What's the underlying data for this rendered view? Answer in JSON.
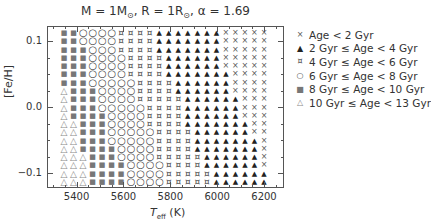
{
  "chart_data": {
    "type": "scatter",
    "title": "M = 1M⊙, R = 1R⊙, α = 1.69",
    "xlabel": "T_eff (K)",
    "ylabel": "[Fe/H]",
    "xlim": [
      5290,
      6300
    ],
    "ylim": [
      -0.17,
      0.17
    ],
    "xticks": [
      5400,
      5600,
      5800,
      6000,
      6200
    ],
    "yticks": [
      0.1,
      0.0,
      -0.1
    ],
    "ytick_labels": [
      "0.1",
      "0.0",
      "−0.1"
    ],
    "grid": false,
    "legend_position": "right",
    "legend": [
      {
        "code": "X",
        "label": "Age < 2 Gyr",
        "symbol": "×",
        "color": "#555555"
      },
      {
        "code": "A",
        "label": "2 Gyr ≤ Age < 4 Gyr",
        "symbol": "▲",
        "color": "#222222"
      },
      {
        "code": "H",
        "label": "4 Gyr ≤ Age < 6 Gyr",
        "symbol": "⌘",
        "color": "#444444"
      },
      {
        "code": "O",
        "label": "6 Gyr ≤ Age < 8 Gyr",
        "symbol": "○",
        "color": "#444444"
      },
      {
        "code": "S",
        "label": "8 Gyr ≤ Age < 10 Gyr",
        "symbol": "■",
        "color": "#777777"
      },
      {
        "code": "T",
        "label": "10 Gyr ≤ Age < 13 Gyr",
        "symbol": "△",
        "color": "#888888"
      }
    ],
    "grid_columns": 22,
    "grid_rows": 19,
    "teff_range": [
      5345,
      6195
    ],
    "feh_range": [
      0.16,
      -0.16
    ],
    "rows_top_to_bottom": [
      "SSOOOOHHHHAAAAAAAXXXXX",
      "SSOOOOHHHHAAAAAAAXXXXX",
      "SSSOOOHHHHAAAAAAAXXXXX",
      "SSSOOOOHHHHAAAAAAXXXXX",
      "SSSOOOOHHHHAAAAAAXXXXX",
      "SSSOOOOHHHHAAAAAAAXXXX",
      "SSSOOOOOHHHHAAAAAAXXXX",
      "TSSSOOOOHHHHAAAAAAXXXX",
      "TSSSOOOOHHHHHAAAAAAXXX",
      "TSSSOOOOOHHHHAAAAAAXXX",
      "TSSSSOOOOHHHHAAAAAAXXX",
      "TTSSSOOOOHHHHAAAAAAAXX",
      "TTSSSOOOOOHHHHAAAAAAXX",
      "TTSSSOOOOOHHHHAAAAAAAX",
      "TTSSSSOOOOHHHHAAAAAAAX",
      "TTTSSSOOOOHHHHHAAAAAAX",
      "TTTSSSSOOOOHHHHAAAAAAX",
      "TTTSSSSOOOOHHHHHAAAAAA",
      "TTTSSSSOOOOHHHHHAAAAAA"
    ]
  },
  "title_main": "M = 1M",
  "title_sun1": "⊙",
  "title_mid": ", R = 1R",
  "title_sun2": "⊙",
  "title_end": ", α = 1.69",
  "xlabel_T": "T",
  "xlabel_sub": "eff",
  "xlabel_unit": " (K)",
  "ylabel": "[Fe/H]"
}
